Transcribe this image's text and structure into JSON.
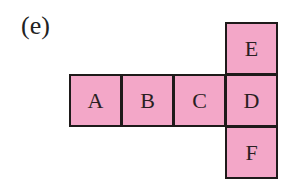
{
  "figure_label": "(e)",
  "colors": {
    "fill": "#f3a7c8",
    "border": "#1e1a1a"
  },
  "squares": [
    {
      "label": "A",
      "x": 69,
      "y": 74
    },
    {
      "label": "B",
      "x": 121,
      "y": 74
    },
    {
      "label": "C",
      "x": 173,
      "y": 74
    },
    {
      "label": "D",
      "x": 225,
      "y": 74
    },
    {
      "label": "E",
      "x": 225,
      "y": 22
    },
    {
      "label": "F",
      "x": 225,
      "y": 126
    }
  ]
}
